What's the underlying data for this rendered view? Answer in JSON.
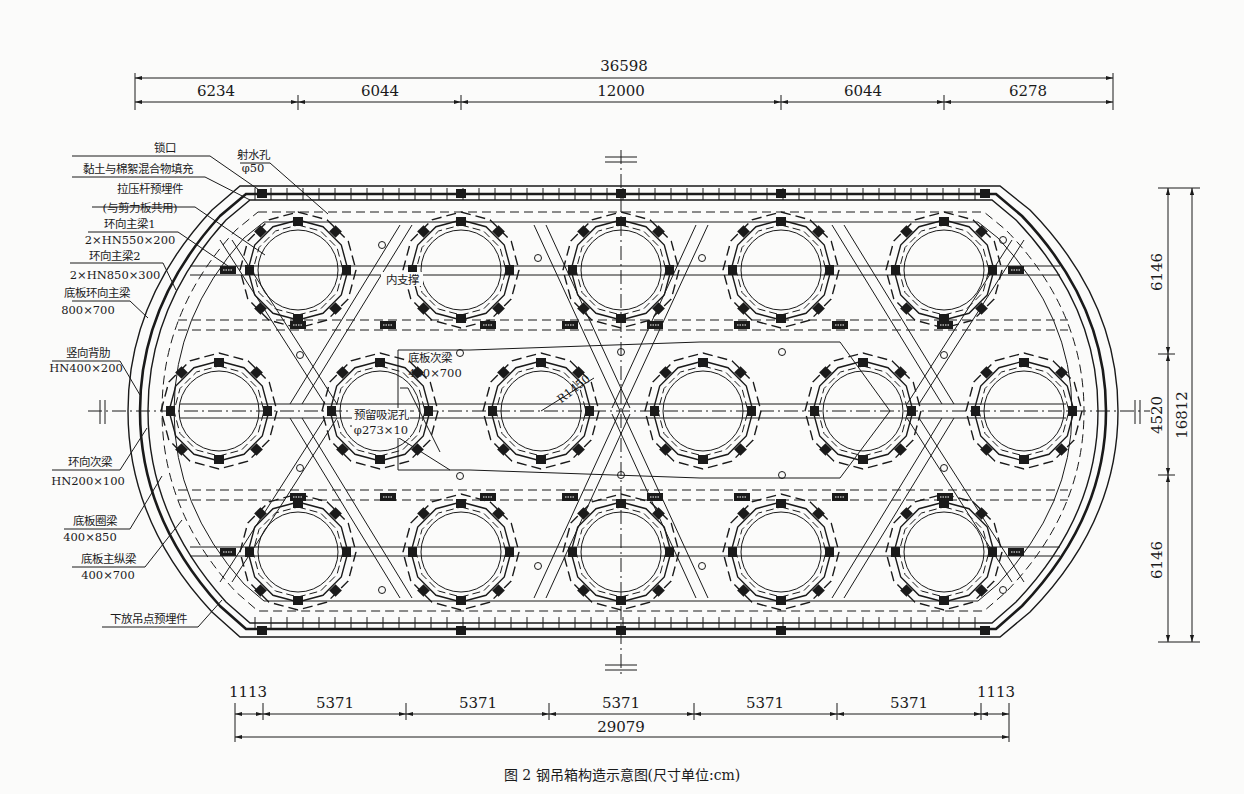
{
  "figure": {
    "caption": "图 2   钢吊箱构造示意图(尺寸单位:cm)",
    "title": "钢吊箱构造示意图",
    "units": "cm"
  },
  "dimensions": {
    "top_total": "36598",
    "top_segments": [
      "6234",
      "6044",
      "12000",
      "6044",
      "6278"
    ],
    "bottom_total": "29079",
    "bottom_segments": [
      "1113",
      "5371",
      "5371",
      "5371",
      "5371",
      "5371",
      "1113"
    ],
    "right_segments": [
      "6146",
      "4520",
      "6146"
    ],
    "right_total": "16812"
  },
  "labels": {
    "lock": "锁口",
    "fill": "黏土与棉絮混合物填充",
    "tie_rod": "拉压杆预埋件",
    "tie_rod_note": "(与剪力板共用)",
    "ring_main_beam_1": "环向主梁1",
    "ring_main_beam_1_spec": "2×HN550×200",
    "ring_main_beam_2": "环向主梁2",
    "ring_main_beam_2_spec": "2×HN850×300",
    "bottom_ring_main_beam": "底板环向主梁",
    "bottom_ring_main_beam_spec": "800×700",
    "vertical_rib": "竖向背肋",
    "vertical_rib_spec": "HN400×200",
    "ring_secondary_beam": "环向次梁",
    "ring_secondary_beam_spec": "HN200×100",
    "bottom_ring_beam": "底板圈梁",
    "bottom_ring_beam_spec": "400×850",
    "bottom_main_long_beam": "底板主纵梁",
    "bottom_main_long_beam_spec": "400×700",
    "lowering_point": "下放吊点预埋件",
    "water_jet_hole": "射水孔",
    "water_jet_hole_spec": "φ50",
    "inner_brace": "内支撑",
    "bottom_secondary_beam": "底板次梁",
    "bottom_secondary_beam_spec": "400×700",
    "mud_suction_hole": "预留吸泥孔",
    "mud_suction_hole_spec": "φ273×10",
    "radius": "R1450"
  }
}
